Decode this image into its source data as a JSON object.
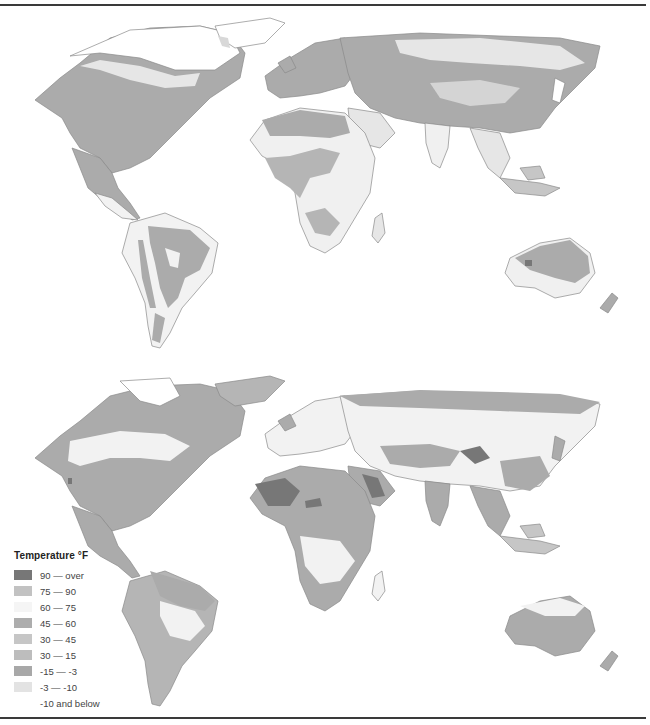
{
  "legend": {
    "title": "Temperature °F",
    "items": [
      {
        "label": "90 — over",
        "color": "#777777"
      },
      {
        "label": "75 — 90",
        "color": "#c2c2c2"
      },
      {
        "label": "60 — 75",
        "color": "#f5f5f5"
      },
      {
        "label": "45 — 60",
        "color": "#adadad"
      },
      {
        "label": "30 — 45",
        "color": "#c6c6c6"
      },
      {
        "label": "30 — 15",
        "color": "#bdbdbd"
      },
      {
        "label": "-15 — -3",
        "color": "#a8a8a8"
      },
      {
        "label": "-3 — -10",
        "color": "#e3e3e3"
      },
      {
        "label": "-10 and below",
        "color": "#ffffff"
      }
    ]
  },
  "maps": [
    {
      "name": "January temperatures (northern winter)"
    },
    {
      "name": "July temperatures (northern summer)"
    }
  ],
  "colors": {
    "coast": "#8a8a8a",
    "rule": "#3a3a3a",
    "hot": "#777777",
    "warm": "#a9a9a9",
    "mild": "#c4c4c4",
    "cool": "#e6e6e6",
    "cold": "#ffffff"
  }
}
